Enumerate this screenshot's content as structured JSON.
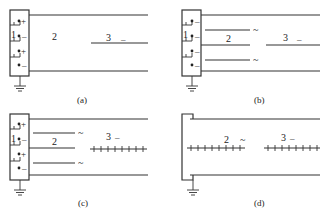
{
  "figure": {
    "panels": [
      {
        "id": "a",
        "caption": "(a)",
        "labels": {
          "source": "1",
          "region2": "2",
          "region3": "3"
        },
        "region3_sign": "–",
        "terminals": [
          "+",
          "–",
          "+",
          "–"
        ],
        "electrodes": "single line (3) to the right",
        "ground": true
      },
      {
        "id": "b",
        "caption": "(b)",
        "labels": {
          "source": "1",
          "region2": "2",
          "region3": "3"
        },
        "region3_sign": "–",
        "region2_signs": [
          "~",
          "~"
        ],
        "terminals": [
          "–",
          "–",
          "–",
          "–"
        ],
        "ground": true
      },
      {
        "id": "c",
        "caption": "(c)",
        "labels": {
          "source": "1",
          "region2": "2",
          "region3": "3"
        },
        "region3_sign": "–",
        "region2_signs": [
          "~",
          "~"
        ],
        "terminals": [
          "+",
          "–",
          "+",
          "–"
        ],
        "region3_style": "comb electrode",
        "ground": true
      },
      {
        "id": "d",
        "caption": "(d)",
        "labels": {
          "region2": "2",
          "region3": "3"
        },
        "region2_sign": "~",
        "region3_sign": "–",
        "region2_style": "comb electrode",
        "region3_style": "comb electrode",
        "ground": true
      }
    ]
  }
}
